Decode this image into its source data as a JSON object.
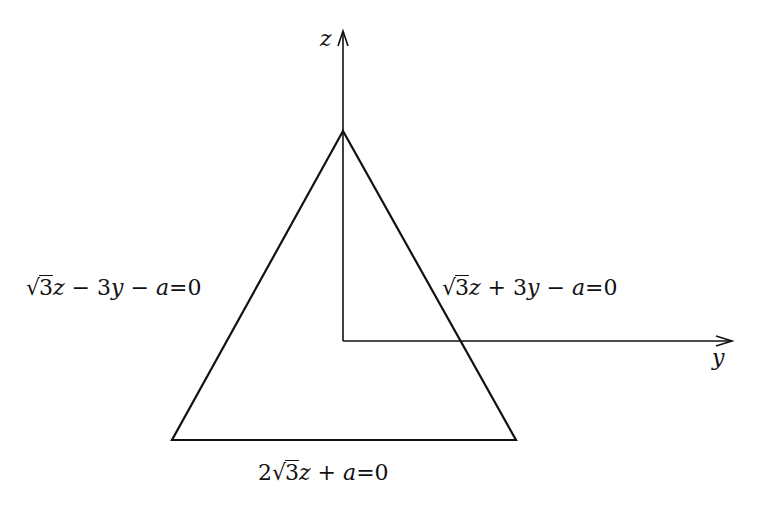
{
  "diagram": {
    "type": "coordinate-diagram",
    "axes": {
      "z": {
        "label": "z"
      },
      "y": {
        "label": "y"
      }
    },
    "labels": {
      "left_side": {
        "prefix": "√",
        "radicand": "3",
        "rest_var": "z",
        "rest": " − 3",
        "var2": "y",
        "tail": " − ",
        "var3": "a",
        "eq": "=0"
      },
      "right_side": {
        "prefix": "√",
        "radicand": "3",
        "rest_var": "z",
        "rest": " + 3",
        "var2": "y",
        "tail": " − ",
        "var3": "a",
        "eq": "=0"
      },
      "bottom_side": {
        "coef": "2",
        "prefix": "√",
        "radicand": "3",
        "rest_var": "z",
        "tail": " + ",
        "var3": "a",
        "eq": "=0"
      }
    },
    "equations": [
      "√3z − 3y − a=0",
      "√3z + 3y − a=0",
      "2√3z + a=0"
    ],
    "colors": {
      "stroke": "#111111",
      "background": "#ffffff"
    }
  }
}
